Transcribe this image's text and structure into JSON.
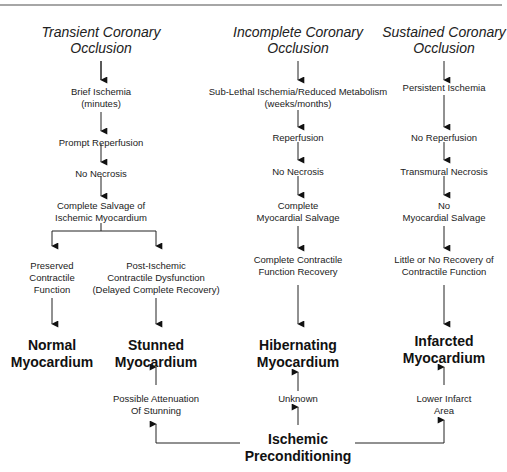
{
  "columns": {
    "transient": {
      "title": [
        "Transient Coronary",
        "Occlusion"
      ],
      "steps": [
        [
          "Brief Ischemia",
          "(minutes)"
        ],
        [
          "Prompt Reperfusion"
        ],
        [
          "No Necrosis"
        ],
        [
          "Complete Salvage of",
          "Ischemic Myocardium"
        ]
      ],
      "branches": {
        "left": {
          "step": [
            "Preserved",
            "Contractile",
            "Function"
          ],
          "outcome": [
            "Normal",
            "Myocardium"
          ]
        },
        "right": {
          "step": [
            "Post-Ischemic",
            "Contractile Dysfunction",
            "(Delayed Complete Recovery)"
          ],
          "outcome": [
            "Stunned",
            "Myocardium"
          ],
          "preconditioning_effect": [
            "Possible Attenuation",
            "Of Stunning"
          ]
        }
      }
    },
    "incomplete": {
      "title": [
        "Incomplete Coronary",
        "Occlusion"
      ],
      "steps": [
        [
          "Sub-Lethal Ischemia/Reduced Metabolism",
          "(weeks/months)"
        ],
        [
          "Reperfusion"
        ],
        [
          "No Necrosis"
        ],
        [
          "Complete",
          "Myocardial Salvage"
        ],
        [
          "Complete Contractile",
          "Function Recovery"
        ]
      ],
      "outcome": [
        "Hibernating",
        "Myocardium"
      ],
      "preconditioning_effect": [
        "Unknown"
      ]
    },
    "sustained": {
      "title": [
        "Sustained Coronary",
        "Occlusion"
      ],
      "steps": [
        [
          "Persistent Ischemia"
        ],
        [
          "No Reperfusion"
        ],
        [
          "Transmural Necrosis"
        ],
        [
          "No",
          "Myocardial Salvage"
        ],
        [
          "Little or No Recovery of",
          "Contractile Function"
        ]
      ],
      "outcome": [
        "Infarcted",
        "Myocardium"
      ],
      "preconditioning_effect": [
        "Lower Infarct",
        "Area"
      ]
    }
  },
  "preconditioning": [
    "Ischemic",
    "Preconditioning"
  ],
  "colors": {
    "line": "#222222",
    "rule": "#888888",
    "text": "#111111"
  }
}
